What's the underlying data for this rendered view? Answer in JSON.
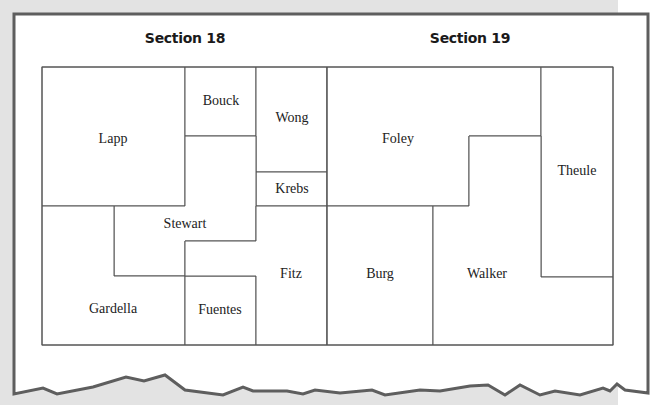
{
  "colors": {
    "background": "#e3e3e3",
    "paper": "#ffffff",
    "paper_border": "#5e5e5e",
    "parcel_line": "#555555",
    "text": "#222222"
  },
  "sections": [
    {
      "title": "Section 18",
      "x": 185,
      "y": 38
    },
    {
      "title": "Section 19",
      "x": 470,
      "y": 38
    }
  ],
  "parcels": [
    {
      "name": "Lapp",
      "label_x": 113,
      "label_y": 139,
      "points": "42,67 185,67 185,206 42,206"
    },
    {
      "name": "Bouck",
      "label_x": 221,
      "label_y": 101,
      "points": "185,67 256,67 256,136 185,136"
    },
    {
      "name": "Wong",
      "label_x": 292,
      "label_y": 118,
      "points": "256,67 327,67 327,172 256,172"
    },
    {
      "name": "Krebs",
      "label_x": 292,
      "label_y": 189,
      "points": "256,172 327,172 327,206 256,206"
    },
    {
      "name": "Stewart",
      "label_x": 185,
      "label_y": 224,
      "points": "185,136 256,136 256,241 185,241 185,276 114,276 114,206 185,206"
    },
    {
      "name": "Gardella",
      "label_x": 113,
      "label_y": 309,
      "points": "42,206 114,206 114,276 185,276 185,345 42,345"
    },
    {
      "name": "Fuentes",
      "label_x": 220,
      "label_y": 310,
      "points": "185,276 256,276 256,345 185,345"
    },
    {
      "name": "Fitz",
      "label_x": 291,
      "label_y": 274,
      "points": "256,206 327,206 327,345 256,345 256,276 185,276 185,241 256,241"
    },
    {
      "name": "Foley",
      "label_x": 398,
      "label_y": 139,
      "points": "327,67 541,67 541,136 469,136 469,206 327,206"
    },
    {
      "name": "Theule",
      "label_x": 577,
      "label_y": 171,
      "points": "541,67 613,67 613,277 541,277"
    },
    {
      "name": "Burg",
      "label_x": 380,
      "label_y": 274,
      "points": "327,206 433,206 433,345 327,345"
    },
    {
      "name": "Walker",
      "label_x": 487,
      "label_y": 274,
      "points": "433,206 469,206 469,136 541,136 541,277 613,277 613,345 433,345"
    }
  ],
  "torn_edge": "14,14 648,14 648,393 625,390 617,384 610,391 603,388 580,395 555,391 540,395 520,385 505,395 488,385 470,386 440,391 420,390 385,395 372,390 340,393 315,390 303,394 287,391 253,391 243,387 223,395 185,390 165,375 144,381 126,377 93,387 57,394 43,388 14,394"
}
